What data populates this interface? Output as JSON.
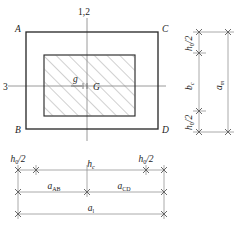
{
  "figure": {
    "colors": {
      "outline": "#2b2b2b",
      "hatch": "#8a8a8a",
      "dimension": "#8e8e8e",
      "text": "#1c1c1c",
      "background": "#ffffff"
    },
    "main_view": {
      "name": "plan-view",
      "corner_labels": {
        "top_left": "A",
        "top_right": "C",
        "bottom_left": "B",
        "bottom_right": "D"
      },
      "axis_labels": {
        "vertical_axis": "1,2",
        "horizontal_axis": "3"
      },
      "centroid_labels": {
        "section_centroid": "g",
        "global_centroid": "G"
      },
      "hatched_region_note": "45-degree diagonal hatch"
    },
    "right_dimensions": {
      "name": "vertical-dimension-stack",
      "entries": [
        {
          "label": "h",
          "sub": "0",
          "suffix": "/2",
          "display": "h0/2"
        },
        {
          "label": "b",
          "sub": "c",
          "suffix": "",
          "display": "bc"
        },
        {
          "label": "h",
          "sub": "0",
          "suffix": "/2",
          "display": "h0/2"
        },
        {
          "label": "a",
          "sub": "m",
          "suffix": "",
          "display": "am"
        }
      ]
    },
    "bottom_dimensions": {
      "name": "horizontal-dimension-stack",
      "row1": [
        {
          "label": "h",
          "sub": "0",
          "suffix": "/2",
          "display": "h0/2"
        },
        {
          "label": "h",
          "sub": "c",
          "suffix": "",
          "display": "hc"
        },
        {
          "label": "h",
          "sub": "0",
          "suffix": "/2",
          "display": "h0/2"
        }
      ],
      "row2": [
        {
          "label": "a",
          "sub": "AB",
          "suffix": "",
          "display": "aAB"
        },
        {
          "label": "a",
          "sub": "CD",
          "suffix": "",
          "display": "aCD"
        }
      ],
      "row3": [
        {
          "label": "a",
          "sub": "l",
          "suffix": "",
          "display": "al"
        }
      ]
    }
  }
}
